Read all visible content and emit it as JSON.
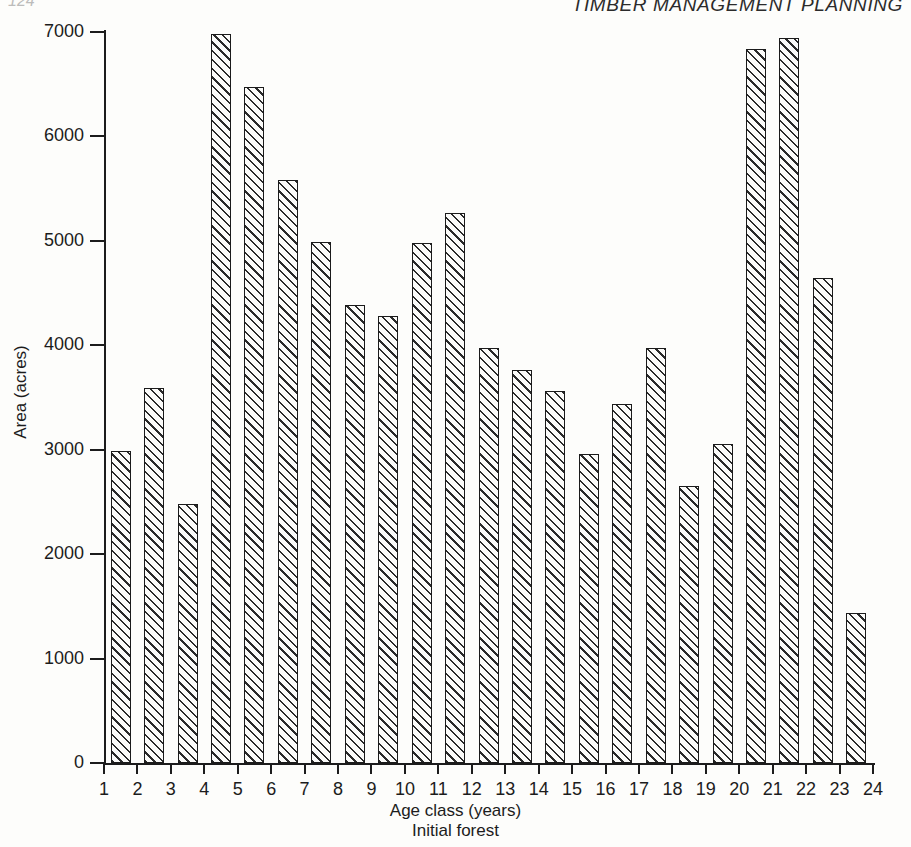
{
  "page": {
    "running_head": "TIMBER MANAGEMENT PLANNING",
    "page_number": "124"
  },
  "chart_data": {
    "type": "bar",
    "title": "",
    "xlabel": "Age class (years)",
    "ylabel": "Area (acres)",
    "caption": "Initial forest",
    "categories": [
      "1",
      "2",
      "3",
      "4",
      "5",
      "6",
      "7",
      "8",
      "9",
      "10",
      "11",
      "12",
      "13",
      "14",
      "15",
      "16",
      "17",
      "18",
      "19",
      "20",
      "21",
      "22",
      "23"
    ],
    "values": [
      2990,
      3590,
      2480,
      6980,
      6470,
      5580,
      4990,
      4390,
      4280,
      4980,
      5270,
      3970,
      3760,
      3560,
      2960,
      3440,
      3970,
      2650,
      3050,
      6840,
      6940,
      4640,
      1440
    ],
    "xtick_labels": [
      "1",
      "2",
      "3",
      "4",
      "5",
      "6",
      "7",
      "8",
      "9",
      "10",
      "11",
      "12",
      "13",
      "14",
      "15",
      "16",
      "17",
      "18",
      "19",
      "20",
      "21",
      "22",
      "23",
      "24"
    ],
    "ytick_labels": [
      "0",
      "1000",
      "2000",
      "3000",
      "4000",
      "5000",
      "6000",
      "7000"
    ],
    "ytick_values": [
      0,
      1000,
      2000,
      3000,
      4000,
      5000,
      6000,
      7000
    ],
    "ylim": [
      0,
      7000
    ],
    "xlim": [
      1,
      24
    ],
    "grid": false,
    "legend": "none",
    "bar_fill": "diagonal-hatch",
    "bar_edge_color": "#1b1b1b",
    "background_color": "#fdfdfb"
  }
}
